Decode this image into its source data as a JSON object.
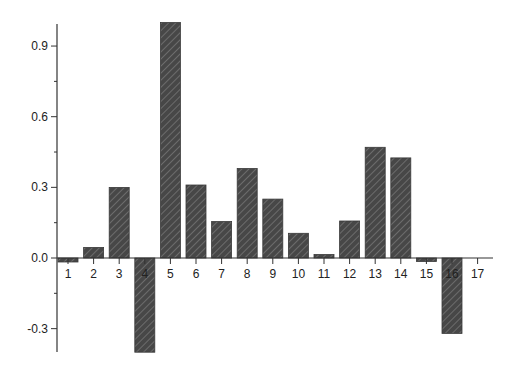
{
  "chart_data": {
    "type": "bar",
    "title": "",
    "xlabel": "",
    "ylabel": "",
    "categories": [
      "1",
      "2",
      "3",
      "4",
      "5",
      "6",
      "7",
      "8",
      "9",
      "10",
      "11",
      "12",
      "13",
      "14",
      "15",
      "16",
      "17"
    ],
    "values": [
      -0.017,
      0.045,
      0.3,
      -0.4,
      1.0,
      0.31,
      0.155,
      0.38,
      0.25,
      0.105,
      0.015,
      0.157,
      0.47,
      0.425,
      -0.015,
      -0.32,
      0.0
    ],
    "ylim": [
      -0.4,
      1.0
    ],
    "yticks": [
      -0.3,
      0.0,
      0.3,
      0.6,
      0.9
    ],
    "ytick_labels": [
      "-0.3",
      "0.0",
      "0.3",
      "0.6",
      "0.9"
    ],
    "grid": false,
    "legend": null,
    "bar_style": {
      "fill": "#4a4a4a",
      "hatch": "diagonal",
      "hatch_color": "#7a7a7a"
    }
  }
}
